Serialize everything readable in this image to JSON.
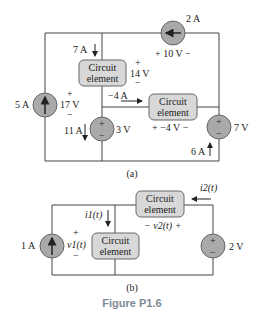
{
  "figure_caption": "Figure P1.6",
  "circuit_a": {
    "label": "(a)",
    "elements": [
      {
        "id": "cs_2A",
        "type": "current-source",
        "value": "2 A",
        "voltage": "+ 10 V −"
      },
      {
        "id": "ce_top",
        "type": "circuit-element",
        "label_l1": "Circuit",
        "label_l2": "element",
        "current": "7 A",
        "voltage_plus": "+",
        "voltage": "14 V",
        "voltage_minus": "−"
      },
      {
        "id": "cs_5A",
        "type": "current-source",
        "value": "5 A",
        "voltage_plus": "+",
        "voltage": "17 V",
        "voltage_minus": "−"
      },
      {
        "id": "ce_mid",
        "type": "circuit-element",
        "label_l1": "Circuit",
        "label_l2": "element",
        "current": "−4 A",
        "voltage": "+ −4 V −"
      },
      {
        "id": "vs_3V",
        "type": "voltage-source",
        "value": "3 V",
        "current": "11 A"
      },
      {
        "id": "vs_7V",
        "type": "voltage-source",
        "value": "7 V",
        "current": "6 A"
      }
    ]
  },
  "circuit_b": {
    "label": "(b)",
    "elements": [
      {
        "id": "cs_1A",
        "type": "current-source",
        "value": "1 A",
        "voltage_plus": "+",
        "voltage": "v1(t)",
        "voltage_minus": "−"
      },
      {
        "id": "ce_b1",
        "type": "circuit-element",
        "label_l1": "Circuit",
        "label_l2": "element",
        "current": "i1(t)"
      },
      {
        "id": "ce_b2",
        "type": "circuit-element",
        "label_l1": "Circuit",
        "label_l2": "element",
        "current": "i2(t)",
        "voltage": "− v2(t) +"
      },
      {
        "id": "vs_2V",
        "type": "voltage-source",
        "value": "2 V"
      }
    ]
  },
  "symbols": {
    "plus": "+",
    "minus": "−"
  }
}
